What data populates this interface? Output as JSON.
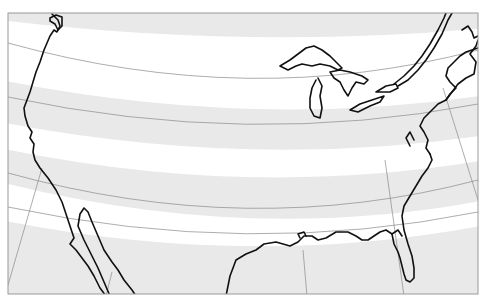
{
  "map": {
    "title": "",
    "region": "Contiguous United States",
    "projection_style": "conic",
    "colors": {
      "band_fill": "#e9e9e9",
      "background": "#ffffff",
      "coastline": "#111111",
      "graticule": "#8a8a8a",
      "frame": "#9a9a9a"
    },
    "features": [
      "alternating latitude bands",
      "coastline outline",
      "Great Lakes",
      "Gulf of California",
      "Florida peninsula",
      "graticule lines"
    ]
  }
}
